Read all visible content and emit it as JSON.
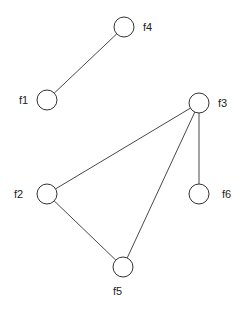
{
  "graph": {
    "nodes": [
      {
        "id": "f1",
        "label": "f1"
      },
      {
        "id": "f2",
        "label": "f2"
      },
      {
        "id": "f3",
        "label": "f3"
      },
      {
        "id": "f4",
        "label": "f4"
      },
      {
        "id": "f5",
        "label": "f5"
      },
      {
        "id": "f6",
        "label": "f6"
      }
    ],
    "edges": [
      {
        "from": "f4",
        "to": "f1"
      },
      {
        "from": "f3",
        "to": "f2"
      },
      {
        "from": "f3",
        "to": "f5"
      },
      {
        "from": "f3",
        "to": "f6"
      },
      {
        "from": "f2",
        "to": "f5"
      }
    ]
  }
}
